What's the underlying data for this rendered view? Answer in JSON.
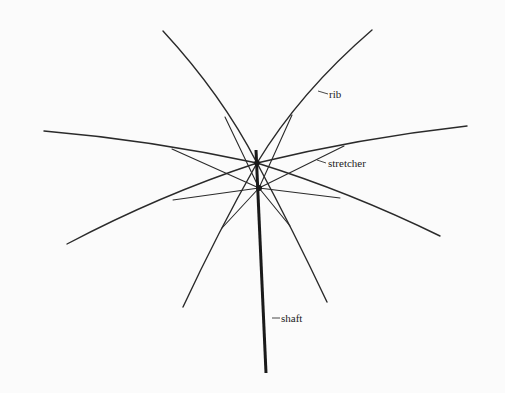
{
  "figure": {
    "type": "umbrella-frame-diagram",
    "background": "#fbfbfb",
    "line_color": "#2a2a2a"
  },
  "labels": {
    "rib": "rib",
    "stretcher": "stretcher",
    "shaft": "shaft"
  },
  "geometry": {
    "top_hub": [
      257,
      163
    ],
    "runner": [
      259,
      188
    ],
    "shaft": {
      "from": [
        256,
        150
      ],
      "to": [
        266,
        373
      ]
    },
    "rib_tips": [
      [
        163,
        31
      ],
      [
        372,
        30
      ],
      [
        44,
        131
      ],
      [
        467,
        126
      ],
      [
        67,
        244
      ],
      [
        440,
        236
      ],
      [
        183,
        307
      ],
      [
        327,
        302
      ]
    ]
  }
}
